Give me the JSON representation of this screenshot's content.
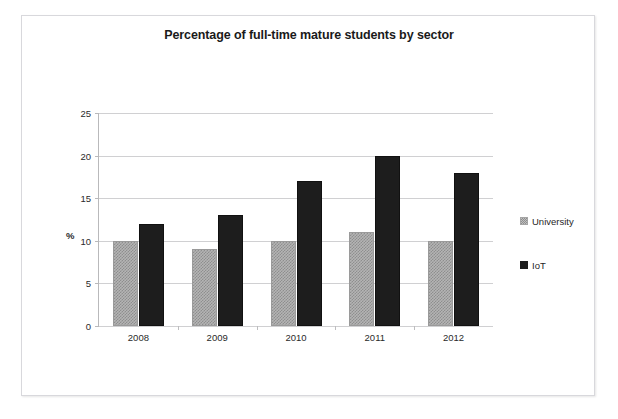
{
  "scan": {
    "top_cut_text": " "
  },
  "chart_data": {
    "type": "bar",
    "title": "Percentage of full-time mature students by sector",
    "xlabel": "",
    "ylabel": "%",
    "categories": [
      "2008",
      "2009",
      "2010",
      "2011",
      "2012"
    ],
    "series": [
      {
        "name": "University",
        "values": [
          10,
          9,
          10,
          11,
          10
        ],
        "color": "#b4b4b4",
        "pattern": "hatched"
      },
      {
        "name": "IoT",
        "values": [
          12,
          13,
          17,
          20,
          18
        ],
        "color": "#1d1d1d",
        "pattern": "solid"
      }
    ],
    "ylim": [
      0,
      25
    ],
    "yticks": [
      0,
      5,
      10,
      15,
      20,
      25
    ],
    "ytick_labels": [
      "0",
      "5",
      "10",
      "15",
      "20",
      "25"
    ],
    "grid": true,
    "grid_axis": "y",
    "legend_position": "right"
  }
}
